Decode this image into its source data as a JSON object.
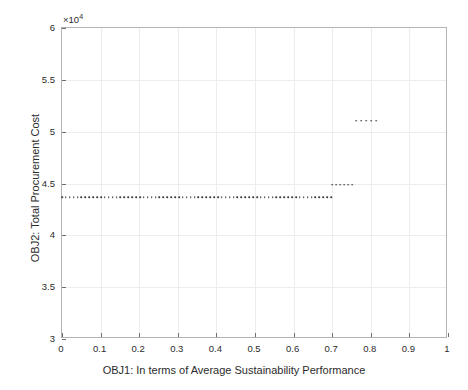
{
  "chart_data": {
    "type": "scatter",
    "title": "",
    "xlabel": "OBJ1: In terms of Average Sustainability Performance",
    "ylabel": "OBJ2: Total Procurement Cost",
    "y_exponent_label": "×10",
    "y_exponent_power": "4",
    "y_scale_factor": 10000,
    "xlim": [
      0,
      1
    ],
    "ylim": [
      30000,
      60000
    ],
    "xticks": [
      0,
      0.1,
      0.2,
      0.3,
      0.4,
      0.5,
      0.6,
      0.7,
      0.8,
      0.9,
      1
    ],
    "xticklabels": [
      "0",
      "0.1",
      "0.2",
      "0.3",
      "0.4",
      "0.5",
      "0.6",
      "0.7",
      "0.8",
      "0.9",
      "1"
    ],
    "yticks": [
      30000,
      35000,
      40000,
      45000,
      50000,
      55000,
      60000
    ],
    "yticklabels": [
      "3",
      "3.5",
      "4",
      "4.5",
      "5",
      "5.5",
      "6"
    ],
    "grid": true,
    "legend": null,
    "marker_color": "#3a3a3a",
    "marker_size": 1.6,
    "series": [
      {
        "name": "Pareto front segment 1",
        "comment": "dense horizontal band of points at constant cost",
        "y_constant": 43700,
        "x_start": 0.0,
        "x_end": 0.697,
        "n_points": 70
      },
      {
        "name": "Pareto front segment 2",
        "comment": "short step up in cost",
        "y_constant": 44900,
        "x_start": 0.7,
        "x_end": 0.752,
        "n_points": 6
      },
      {
        "name": "Pareto front segment 3",
        "comment": "upper isolated cluster",
        "y_constant": 51050,
        "x_start": 0.762,
        "x_end": 0.814,
        "n_points": 5
      }
    ]
  }
}
